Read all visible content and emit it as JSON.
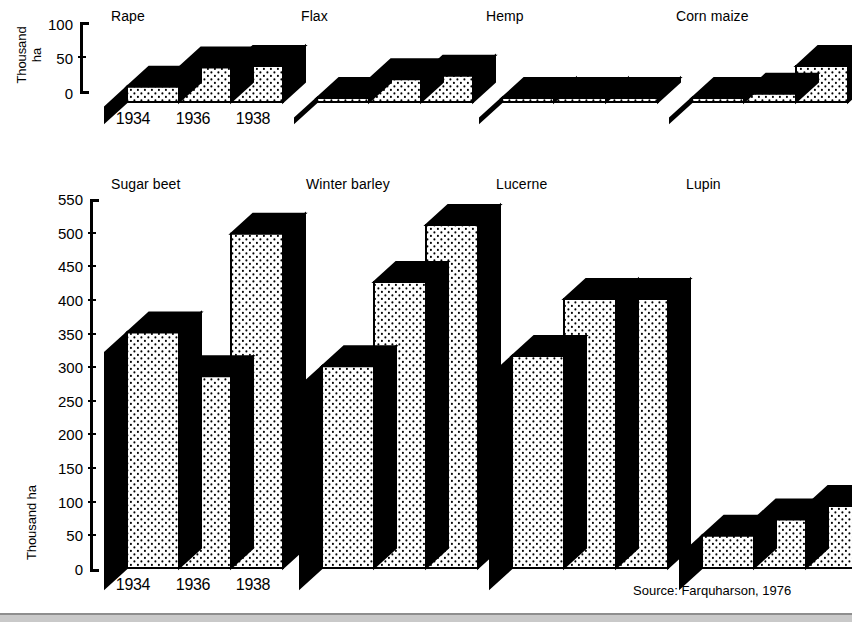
{
  "figure": {
    "source_note": "Source: Farquharson, 1976",
    "ink_color": "#000000",
    "fill_color": "#ffffff",
    "background": "#ffffff"
  },
  "axes": {
    "top": {
      "title_line1": "Thousand",
      "title_line2": "ha",
      "ticks": [
        "0",
        "50",
        "100"
      ],
      "min": 0,
      "max": 100
    },
    "bottom": {
      "title": "Thousand ha",
      "ticks": [
        "0",
        "50",
        "100",
        "150",
        "200",
        "250",
        "300",
        "350",
        "400",
        "450",
        "500",
        "550"
      ],
      "min": 0,
      "max": 550
    }
  },
  "categories": [
    "1934",
    "1936",
    "1938"
  ],
  "panels": {
    "rape": {
      "title": "Rape"
    },
    "flax": {
      "title": "Flax"
    },
    "hemp": {
      "title": "Hemp"
    },
    "corn_maize": {
      "title": "Corn maize"
    },
    "sugar_beet": {
      "title": "Sugar beet"
    },
    "winter_barley": {
      "title": "Winter barley"
    },
    "lucerne": {
      "title": "Lucerne"
    },
    "lupin": {
      "title": "Lupin"
    }
  },
  "chart_data": {
    "type": "bar",
    "xlabel": "",
    "ylabel": "Thousand ha",
    "grid": false,
    "legend": "none",
    "note": "Eight small-multiple panels of 3-D block bars; top row shares a 0-100 axis, bottom row a 0-550 axis.",
    "categories": [
      "1934",
      "1936",
      "1938"
    ],
    "panels": [
      {
        "name": "Rape",
        "row": "top",
        "ylim": [
          0,
          100
        ],
        "values": [
          22,
          50,
          52
        ]
      },
      {
        "name": "Flax",
        "row": "top",
        "ylim": [
          0,
          100
        ],
        "values": [
          3,
          33,
          38
        ]
      },
      {
        "name": "Hemp",
        "row": "top",
        "ylim": [
          0,
          100
        ],
        "values": [
          2,
          3,
          4
        ]
      },
      {
        "name": "Corn maize",
        "row": "top",
        "ylim": [
          0,
          100
        ],
        "values": [
          5,
          12,
          52
        ]
      },
      {
        "name": "Sugar beet",
        "row": "bottom",
        "ylim": [
          0,
          550
        ],
        "values": [
          350,
          285,
          497
        ]
      },
      {
        "name": "Winter barley",
        "row": "bottom",
        "ylim": [
          0,
          550
        ],
        "values": [
          300,
          425,
          510
        ]
      },
      {
        "name": "Lucerne",
        "row": "bottom",
        "ylim": [
          0,
          550
        ],
        "values": [
          315,
          400,
          400
        ]
      },
      {
        "name": "Lupin",
        "row": "bottom",
        "ylim": [
          0,
          550
        ],
        "values": [
          48,
          72,
          92
        ]
      }
    ]
  }
}
